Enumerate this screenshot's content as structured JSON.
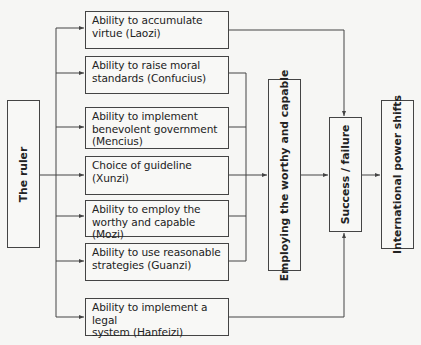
{
  "diagram": {
    "source": {
      "label": "The ruler"
    },
    "factors": [
      {
        "label": "Ability to accumulate\nvirtue (Laozi)",
        "thinker": "Laozi",
        "target": "success_failure"
      },
      {
        "label": "Ability to raise moral\nstandards (Confucius)",
        "thinker": "Confucius",
        "target": "employing"
      },
      {
        "label": "Ability to implement\nbenevolent government\n(Mencius)",
        "thinker": "Mencius",
        "target": "employing"
      },
      {
        "label": "Choice of guideline\n(Xunzi)",
        "thinker": "Xunzi",
        "target": "employing"
      },
      {
        "label": "Ability to employ the\nworthy and capable (Mozi)",
        "thinker": "Mozi",
        "target": "employing"
      },
      {
        "label": "Ability to use reasonable\nstrategies (Guanzi)",
        "thinker": "Guanzi",
        "target": "employing"
      },
      {
        "label": "Ability to implement a legal\nsystem (Hanfeizi)",
        "thinker": "Hanfeizi",
        "target": "success_failure"
      }
    ],
    "employing": {
      "label": "Employing the worthy and capable"
    },
    "success_failure": {
      "label": "Success / failure"
    },
    "outcome": {
      "label": "International power shifts"
    },
    "colors": {
      "line": "#444444",
      "background": "#f6f6f4",
      "box_fill": "#f8f8f6"
    }
  }
}
